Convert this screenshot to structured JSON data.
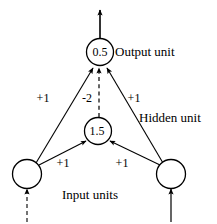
{
  "diagram": {
    "nodes": {
      "output": {
        "label": "0.5",
        "name": "output-unit",
        "caption": "Output unit"
      },
      "hidden": {
        "label": "1.5",
        "name": "hidden-unit",
        "caption": "Hidden unit"
      },
      "input_left": {
        "label": "",
        "name": "input-unit-left"
      },
      "input_right": {
        "label": "",
        "name": "input-unit-right"
      },
      "inputs_caption": "Input units"
    },
    "weights": {
      "left_input_to_output": "+1",
      "hidden_to_output": "-2",
      "right_input_to_output": "+1",
      "left_input_to_hidden": "+1",
      "right_input_to_hidden": "+1"
    },
    "colors": {
      "stroke": "#000000",
      "background": "#ffffff",
      "arrow_tail": "#555555"
    }
  }
}
